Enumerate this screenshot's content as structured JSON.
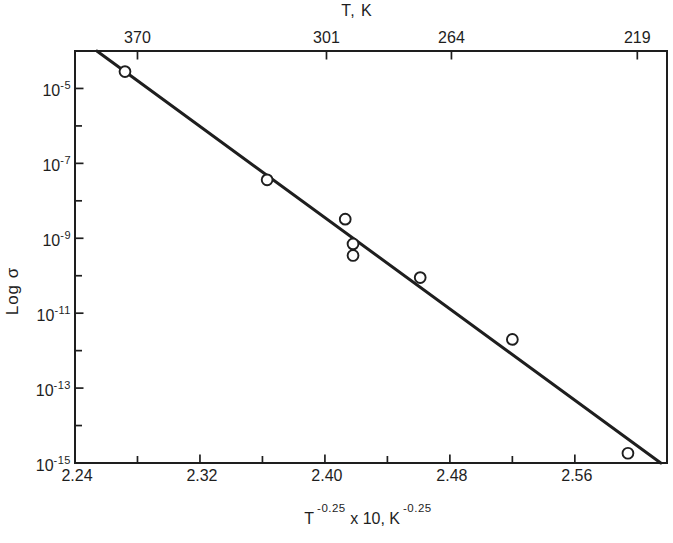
{
  "chart_data": {
    "type": "scatter",
    "title": "",
    "y_label": "Log σ",
    "x_label": {
      "base1": "T",
      "exp1": "-0.25",
      "middle": " x 10, K",
      "exp2": "-0.25",
      "plain": "T^-0.25 x 10, K^-0.25"
    },
    "top_axis": {
      "title": "T, K",
      "ticks": [
        {
          "label": "370",
          "x_pos": 2.28
        },
        {
          "label": "301",
          "x_pos": 2.401
        },
        {
          "label": "264",
          "x_pos": 2.481
        },
        {
          "label": "219",
          "x_pos": 2.6
        }
      ]
    },
    "x_axis": {
      "major_ticks": [
        {
          "label": "2.24",
          "x": 2.24,
          "draw_tick": false
        },
        {
          "label": "2.32",
          "x": 2.32,
          "draw_tick": true
        },
        {
          "label": "2.40",
          "x": 2.4,
          "draw_tick": true
        },
        {
          "label": "2.48",
          "x": 2.48,
          "draw_tick": true
        },
        {
          "label": "2.56",
          "x": 2.56,
          "draw_tick": true
        }
      ],
      "minor_ticks": [
        2.28,
        2.36,
        2.44,
        2.52
      ],
      "range": [
        2.24,
        2.619
      ]
    },
    "y_axis": {
      "scale": "log",
      "major_tick_exponents": [
        -5,
        -7,
        -9,
        -11,
        -13,
        -15
      ],
      "minor_tick_exponents": [
        -6,
        -8,
        -10,
        -12,
        -14
      ],
      "exp_range": [
        -4,
        -15
      ],
      "label_base": "10"
    },
    "points": [
      {
        "x": 2.272,
        "log_sigma": -4.55
      },
      {
        "x": 2.363,
        "log_sigma": -7.44
      },
      {
        "x": 2.413,
        "log_sigma": -8.49
      },
      {
        "x": 2.418,
        "log_sigma": -9.15
      },
      {
        "x": 2.418,
        "log_sigma": -9.46
      },
      {
        "x": 2.461,
        "log_sigma": -10.05
      },
      {
        "x": 2.52,
        "log_sigma": -11.7
      },
      {
        "x": 2.594,
        "log_sigma": -14.74
      }
    ],
    "fit_line": {
      "x1": 2.254,
      "log_sigma1": -4.0,
      "x2": 2.615,
      "log_sigma2": -15.0
    },
    "colors": {
      "ink": "#1e1e1e",
      "background": "#ffffff"
    }
  }
}
